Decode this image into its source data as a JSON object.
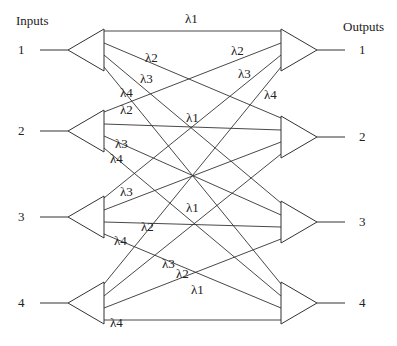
{
  "headers": {
    "inputs": "Inputs",
    "outputs": "Outputs"
  },
  "inputs": [
    {
      "label": "1",
      "y": 50
    },
    {
      "label": "2",
      "y": 131
    },
    {
      "label": "3",
      "y": 217
    },
    {
      "label": "4",
      "y": 303
    }
  ],
  "outputs": [
    {
      "label": "1",
      "y": 50
    },
    {
      "label": "2",
      "y": 137
    },
    {
      "label": "3",
      "y": 222
    },
    {
      "label": "4",
      "y": 303
    }
  ],
  "wavelength_labels": [
    {
      "text": "λ1",
      "x": 185,
      "y": 12
    },
    {
      "text": "λ2",
      "x": 145,
      "y": 51
    },
    {
      "text": "λ3",
      "x": 140,
      "y": 72
    },
    {
      "text": "λ4",
      "x": 120,
      "y": 86
    },
    {
      "text": "λ2",
      "x": 231,
      "y": 44
    },
    {
      "text": "λ3",
      "x": 238,
      "y": 67
    },
    {
      "text": "λ4",
      "x": 264,
      "y": 88
    },
    {
      "text": "λ2",
      "x": 120,
      "y": 103
    },
    {
      "text": "λ1",
      "x": 186,
      "y": 111
    },
    {
      "text": "λ3",
      "x": 115,
      "y": 137
    },
    {
      "text": "λ4",
      "x": 110,
      "y": 152
    },
    {
      "text": "λ3",
      "x": 120,
      "y": 185
    },
    {
      "text": "λ1",
      "x": 186,
      "y": 201
    },
    {
      "text": "λ2",
      "x": 141,
      "y": 220
    },
    {
      "text": "λ4",
      "x": 114,
      "y": 234
    },
    {
      "text": "λ3",
      "x": 162,
      "y": 257
    },
    {
      "text": "λ2",
      "x": 176,
      "y": 267
    },
    {
      "text": "λ1",
      "x": 191,
      "y": 283
    },
    {
      "text": "λ4",
      "x": 110,
      "y": 316
    }
  ]
}
